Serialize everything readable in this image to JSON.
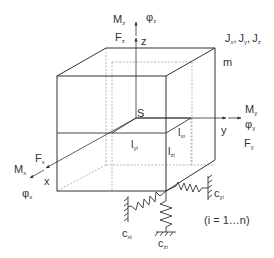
{
  "diagram": {
    "colors": {
      "line": "#333333",
      "hidden": "#999999",
      "background": "#ffffff"
    },
    "labels": {
      "Mz": {
        "main": "M",
        "sub": "z"
      },
      "phiz": {
        "main": "φ",
        "sub": "z"
      },
      "Fz": {
        "main": "F",
        "sub": "z"
      },
      "z_axis": "z",
      "J": {
        "jx_main": "J",
        "jx_sub": "x",
        "jy_main": "J",
        "jy_sub": "y",
        "jz_main": "J",
        "jz_sub": "z",
        "sep": ","
      },
      "m": "m",
      "S": "S",
      "y_axis": "y",
      "My": {
        "main": "M",
        "sub": "y"
      },
      "phiy": {
        "main": "φ",
        "sub": "y"
      },
      "Fy": {
        "main": "F",
        "sub": "y"
      },
      "lxi": {
        "main": "l",
        "sub": "xi"
      },
      "lyi": {
        "main": "l",
        "sub": "yi"
      },
      "lzi": {
        "main": "l",
        "sub": "zi"
      },
      "Fx": {
        "main": "F",
        "sub": "x"
      },
      "Mx": {
        "main": "M",
        "sub": "x"
      },
      "x_axis": "x",
      "phix": {
        "main": "φ",
        "sub": "x"
      },
      "cyi": {
        "main": "c",
        "sub": "yi"
      },
      "cxi": {
        "main": "c",
        "sub": "xi"
      },
      "czi": {
        "main": "c",
        "sub": "zi"
      },
      "range": "(i = 1…n)"
    }
  }
}
